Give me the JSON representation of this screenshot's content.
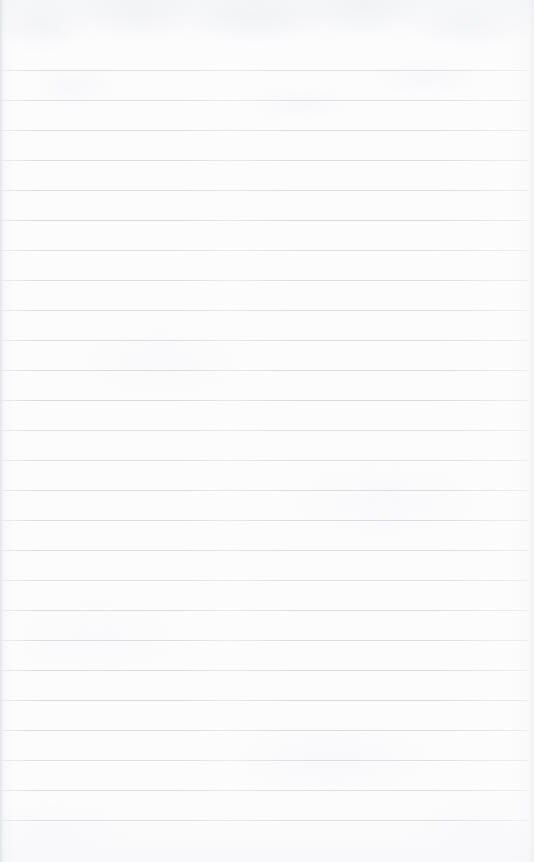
{
  "document": {
    "kind": "scanned-ruled-notebook-page",
    "title": "Blank ruled paper",
    "page_width": 534,
    "page_height": 862,
    "text_content": "",
    "has_handwriting": false,
    "has_printed_text": false,
    "has_margin_rule": false,
    "has_punch_holes": false,
    "colors": {
      "paper": "#fcfcfd",
      "rule_line": "#d9dbdf",
      "edge_shadow": "#e1e3e8",
      "texture_tint": "#eef0f3"
    },
    "ruling": {
      "orientation": "horizontal",
      "line_count": 26,
      "spacing_px": 30,
      "first_line_y": 70,
      "last_line_y": 823,
      "line_thickness_px": 1,
      "line_start_x": 0,
      "line_end_x": 528,
      "top_margin_px": 70,
      "bottom_margin_px": 39,
      "line_positions": [
        70,
        100,
        130,
        160,
        190,
        220,
        250,
        280,
        310,
        340,
        343,
        373,
        403,
        433,
        463,
        493,
        523,
        553,
        583,
        613,
        643,
        673,
        703,
        733,
        763,
        793,
        823
      ]
    }
  }
}
